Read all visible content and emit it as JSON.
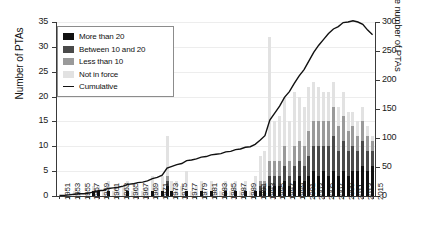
{
  "chart_data": {
    "type": "bar",
    "title": "",
    "xlabel": "",
    "ylabel": "Number of PTAs",
    "y2label": "Cumulative number of PTAs",
    "ylim": [
      0,
      35
    ],
    "y2lim": [
      0,
      300
    ],
    "yticks": [
      0,
      5,
      10,
      15,
      20,
      25,
      30,
      35
    ],
    "y2ticks": [
      0,
      50,
      100,
      150,
      200,
      250,
      300
    ],
    "grid": true,
    "legend_position": "top-left",
    "stacked": true,
    "categories": [
      1951,
      1952,
      1953,
      1954,
      1955,
      1956,
      1957,
      1958,
      1959,
      1960,
      1961,
      1962,
      1963,
      1964,
      1965,
      1966,
      1967,
      1968,
      1969,
      1970,
      1971,
      1972,
      1973,
      1974,
      1975,
      1976,
      1977,
      1978,
      1979,
      1980,
      1981,
      1982,
      1983,
      1984,
      1985,
      1986,
      1987,
      1988,
      1989,
      1990,
      1991,
      1992,
      1993,
      1994,
      1995,
      1996,
      1997,
      1998,
      1999,
      2000,
      2001,
      2002,
      2003,
      2004,
      2005,
      2006,
      2007,
      2008,
      2009,
      2010,
      2011,
      2012,
      2013,
      2014,
      2015
    ],
    "tick_labels": [
      "1951",
      "1953",
      "1955",
      "1957",
      "1959",
      "1961",
      "1963",
      "1965",
      "1967",
      "1969",
      "1971",
      "1973",
      "1975",
      "1977",
      "1979",
      "1981",
      "1983",
      "1985",
      "1987",
      "1989",
      "1991",
      "1993",
      "1995",
      "1997",
      "1999",
      "2001",
      "2003",
      "2005",
      "2007",
      "2009",
      "2011",
      "2013",
      "2015"
    ],
    "series": [
      {
        "name": "More than 20",
        "color": "#111111",
        "values": [
          0,
          0,
          0,
          0,
          0,
          0,
          0,
          1,
          1,
          0,
          1,
          0,
          0,
          0,
          1,
          0,
          0,
          0,
          0,
          1,
          0,
          1,
          2,
          1,
          0,
          0,
          1,
          0,
          0,
          1,
          0,
          1,
          0,
          0,
          1,
          0,
          1,
          0,
          1,
          0,
          1,
          1,
          1,
          2,
          2,
          2,
          3,
          2,
          3,
          4,
          3,
          4,
          5,
          4,
          5,
          4,
          5,
          4,
          5,
          4,
          5,
          5,
          6,
          5,
          6
        ]
      },
      {
        "name": "Between 10 and 20",
        "color": "#4a4a4a",
        "values": [
          0,
          0,
          0,
          0,
          0,
          0,
          0,
          0,
          0,
          0,
          0,
          0,
          0,
          0,
          0,
          0,
          0,
          0,
          0,
          0,
          0,
          0,
          1,
          0,
          0,
          0,
          0,
          0,
          0,
          0,
          0,
          0,
          0,
          0,
          0,
          0,
          0,
          0,
          0,
          0,
          0,
          1,
          1,
          2,
          2,
          2,
          3,
          2,
          3,
          3,
          3,
          4,
          5,
          6,
          5,
          6,
          7,
          5,
          6,
          5,
          5,
          4,
          5,
          4,
          3
        ]
      },
      {
        "name": "Less than 10",
        "color": "#9a9a9a",
        "values": [
          0,
          0,
          0,
          0,
          0,
          0,
          0,
          0,
          0,
          0,
          0,
          0,
          0,
          0,
          0,
          0,
          0,
          0,
          0,
          0,
          0,
          0,
          1,
          0,
          0,
          0,
          0,
          0,
          0,
          0,
          0,
          0,
          0,
          0,
          0,
          0,
          0,
          0,
          0,
          0,
          0,
          1,
          1,
          3,
          3,
          3,
          4,
          3,
          4,
          4,
          4,
          5,
          5,
          5,
          5,
          5,
          6,
          5,
          5,
          4,
          4,
          3,
          4,
          3,
          2
        ]
      },
      {
        "name": "Not in force",
        "color": "#e2e2e2",
        "values": [
          0,
          0,
          0,
          1,
          1,
          0,
          1,
          1,
          1,
          1,
          2,
          1,
          1,
          2,
          2,
          1,
          2,
          1,
          2,
          3,
          2,
          3,
          8,
          2,
          3,
          2,
          4,
          1,
          2,
          2,
          1,
          2,
          1,
          1,
          2,
          1,
          2,
          1,
          2,
          1,
          3,
          5,
          6,
          25,
          8,
          9,
          10,
          8,
          11,
          9,
          8,
          9,
          8,
          7,
          6,
          6,
          5,
          4,
          5,
          4,
          3,
          3,
          3,
          2,
          1
        ]
      }
    ],
    "line_series": {
      "name": "Cumulative",
      "color": "#111111",
      "axis": "right",
      "values": [
        1,
        1,
        2,
        3,
        4,
        4,
        5,
        7,
        9,
        10,
        13,
        14,
        15,
        17,
        20,
        21,
        23,
        24,
        26,
        30,
        32,
        36,
        48,
        51,
        54,
        56,
        61,
        62,
        64,
        67,
        68,
        71,
        72,
        73,
        76,
        77,
        80,
        81,
        84,
        85,
        89,
        96,
        104,
        131,
        143,
        155,
        170,
        180,
        194,
        207,
        218,
        233,
        248,
        260,
        270,
        280,
        288,
        292,
        299,
        300,
        302,
        300,
        296,
        286,
        278
      ]
    }
  },
  "legend": {
    "items": [
      {
        "label": "More than 20",
        "type": "swatch"
      },
      {
        "label": "Between 10 and 20",
        "type": "swatch"
      },
      {
        "label": "Less than 10",
        "type": "swatch"
      },
      {
        "label": "Not in force",
        "type": "swatch"
      },
      {
        "label": "Cumulative",
        "type": "line"
      }
    ]
  }
}
